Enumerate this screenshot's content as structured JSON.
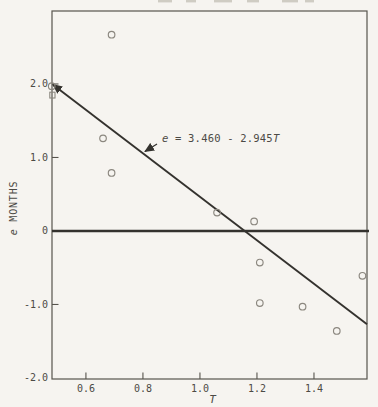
{
  "chart_data": {
    "type": "scatter",
    "title": "",
    "xlabel": "T",
    "ylabel": "e MONTHS",
    "ylabel_parts": {
      "italic": "e",
      "rest": " MONTHS"
    },
    "xlim": [
      0.481,
      1.586
    ],
    "ylim": [
      -2.014,
      2.993
    ],
    "x_ticks": [
      0.6,
      0.8,
      1.0,
      1.2,
      1.4
    ],
    "y_ticks": [
      2.0,
      1.0,
      0,
      -1.0,
      -2.0
    ],
    "grid": false,
    "legend_position": "none",
    "points": [
      [
        0.69,
        2.67
      ],
      [
        0.48,
        1.97
      ],
      [
        0.66,
        1.26
      ],
      [
        0.69,
        0.79
      ],
      [
        1.06,
        0.25
      ],
      [
        1.19,
        0.13
      ],
      [
        1.21,
        -0.43
      ],
      [
        1.57,
        -0.61
      ],
      [
        1.21,
        -0.98
      ],
      [
        1.36,
        -1.03
      ],
      [
        1.48,
        -1.36
      ]
    ],
    "square_marker_point": [
      0.481,
      1.85
    ],
    "zero_line_e": 0,
    "fit_line": {
      "equation_label": "e = 3.460 - 2.945T",
      "label_parts": {
        "lhs_italic": "e",
        "mid": " = 3.460 - 2.945",
        "rhs_italic": "T"
      },
      "intercept": 3.46,
      "slope": -2.945,
      "draw_T": [
        0.481,
        1.586
      ],
      "draw_e": [
        1.99,
        -1.27
      ],
      "arrow_at_start": true
    },
    "colors": {
      "background": "#f6f4f0",
      "axis": "#57544d",
      "line": "#34322e",
      "marker": "#8b877f",
      "text": "#4c4a45",
      "fragment": "#c6c2b8"
    }
  }
}
